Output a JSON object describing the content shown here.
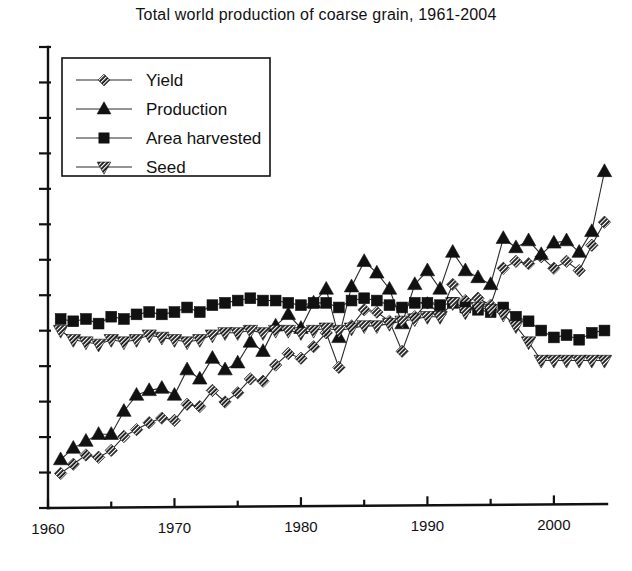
{
  "chart_data": {
    "type": "line",
    "title": "Total world production of coarse grain, 1961-2004",
    "xlabel": "",
    "ylabel": "",
    "xlim": [
      1960,
      2004
    ],
    "ylim": [
      0,
      100
    ],
    "grid": false,
    "legend_position": "upper-left",
    "xticks": [
      "1960",
      "1970",
      "1980",
      "1990",
      "2000"
    ],
    "xtick_values": [
      1960,
      1970,
      1980,
      1990,
      2000
    ],
    "xminor_ticks": [
      1965,
      1975,
      1985,
      1995
    ],
    "yticks": [],
    "ytick_labels": [],
    "x": [
      1961,
      1962,
      1963,
      1964,
      1965,
      1966,
      1967,
      1968,
      1969,
      1970,
      1971,
      1972,
      1973,
      1974,
      1975,
      1976,
      1977,
      1978,
      1979,
      1980,
      1981,
      1982,
      1983,
      1984,
      1985,
      1986,
      1987,
      1988,
      1989,
      1990,
      1991,
      1992,
      1993,
      1994,
      1995,
      1996,
      1997,
      1998,
      1999,
      2000,
      2001,
      2002,
      2003,
      2004
    ],
    "series": [
      {
        "name": "Yield",
        "marker": "diamond",
        "values": [
          7.5,
          9.5,
          11.5,
          11.0,
          12.5,
          15.5,
          17.0,
          18.5,
          19.5,
          19.0,
          22.5,
          22.0,
          25.5,
          23.0,
          25.0,
          28.0,
          27.5,
          31.0,
          33.5,
          32.5,
          35.0,
          38.0,
          30.5,
          39.5,
          43.0,
          42.5,
          40.5,
          34.0,
          41.5,
          44.5,
          42.0,
          48.5,
          45.0,
          45.5,
          44.0,
          52.0,
          53.5,
          53.0,
          54.5,
          52.0,
          53.5,
          51.5,
          57.0,
          62.0
        ]
      },
      {
        "name": "Production",
        "marker": "triangle-up",
        "values": [
          10.5,
          13.0,
          14.5,
          16.0,
          16.0,
          21.0,
          24.5,
          25.5,
          26.0,
          24.5,
          30.0,
          28.0,
          32.5,
          30.0,
          31.5,
          36.0,
          34.0,
          39.5,
          42.0,
          39.0,
          44.5,
          47.5,
          37.0,
          48.0,
          53.5,
          51.0,
          47.5,
          40.0,
          48.5,
          51.5,
          47.5,
          55.5,
          51.5,
          50.0,
          48.5,
          58.5,
          56.5,
          58.0,
          55.0,
          57.5,
          58.0,
          55.5,
          60.0,
          73.0
        ]
      },
      {
        "name": "Area harvested",
        "marker": "square",
        "values": [
          41.0,
          40.5,
          41.0,
          40.0,
          41.5,
          41.0,
          42.0,
          42.5,
          42.0,
          42.5,
          43.5,
          42.5,
          44.0,
          44.5,
          45.0,
          45.5,
          45.0,
          45.0,
          44.5,
          44.0,
          44.5,
          44.5,
          43.5,
          45.0,
          45.5,
          45.0,
          44.0,
          43.5,
          44.5,
          44.5,
          44.0,
          44.5,
          43.5,
          43.0,
          42.5,
          43.5,
          41.5,
          40.5,
          38.5,
          37.0,
          37.5,
          36.5,
          38.0,
          38.5
        ]
      },
      {
        "name": "Seed",
        "marker": "triangle-down",
        "values": [
          38.5,
          36.5,
          36.0,
          35.5,
          36.5,
          36.0,
          36.5,
          37.5,
          37.0,
          36.5,
          36.0,
          36.5,
          37.5,
          38.0,
          38.0,
          38.5,
          38.0,
          38.5,
          38.5,
          38.0,
          38.5,
          39.0,
          38.5,
          39.0,
          39.5,
          39.5,
          40.0,
          40.5,
          41.0,
          41.5,
          41.5,
          44.5,
          42.5,
          43.5,
          43.0,
          42.0,
          39.5,
          36.0,
          32.0,
          32.0,
          32.0,
          32.0,
          32.0,
          32.0
        ]
      }
    ]
  },
  "legend": {
    "items": [
      {
        "label": "Yield",
        "marker": "diamond"
      },
      {
        "label": "Production",
        "marker": "triangle-up"
      },
      {
        "label": "Area harvested",
        "marker": "square"
      },
      {
        "label": "Seed",
        "marker": "triangle-down"
      }
    ]
  },
  "colors": {
    "ink": "#111111",
    "line": "#2b2b2b",
    "background": "#ffffff"
  }
}
